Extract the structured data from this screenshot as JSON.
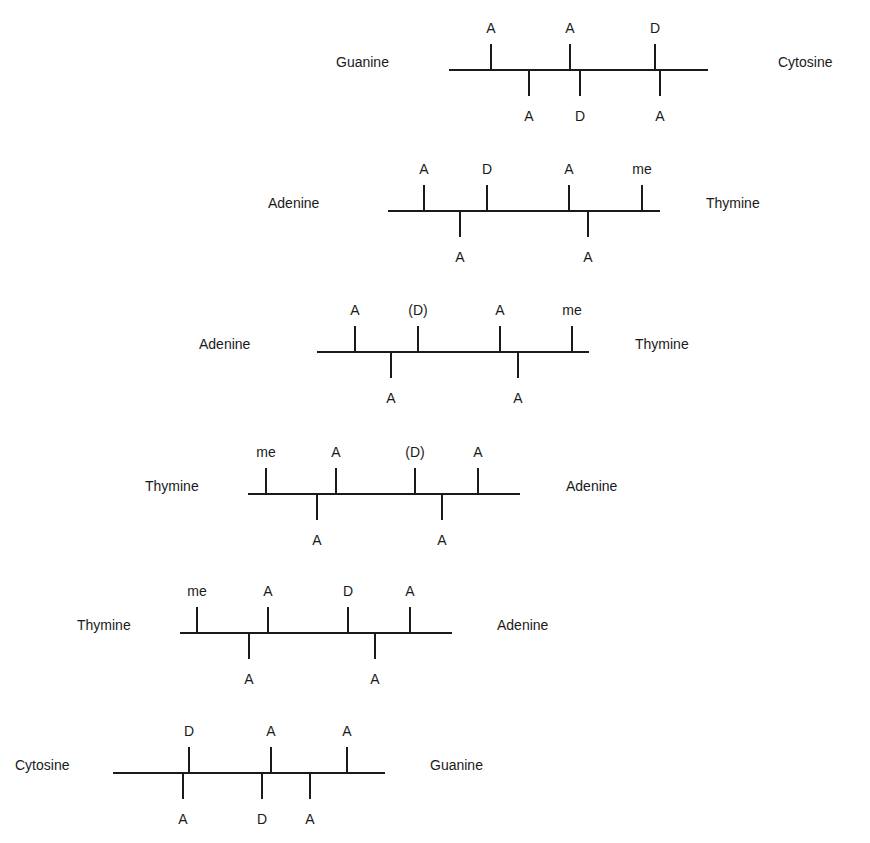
{
  "diagram": {
    "type": "base-pair hydrogen-bond acceptor/donor pattern diagram",
    "legend_codes": {
      "A": "acceptor",
      "D": "donor",
      "(D)": "weak donor",
      "me": "methyl"
    },
    "pairs": [
      {
        "left_base": "Guanine",
        "right_base": "Cytosine",
        "line": {
          "x1": 449,
          "x2": 708,
          "y": 70
        },
        "left_label_x": 336,
        "right_label_x": 778,
        "above": [
          {
            "x": 491,
            "label": "A"
          },
          {
            "x": 570,
            "label": "A"
          },
          {
            "x": 655,
            "label": "D"
          }
        ],
        "below": [
          {
            "x": 529,
            "label": "A"
          },
          {
            "x": 580,
            "label": "D"
          },
          {
            "x": 660,
            "label": "A"
          }
        ]
      },
      {
        "left_base": "Adenine",
        "right_base": "Thymine",
        "line": {
          "x1": 388,
          "x2": 660,
          "y": 211
        },
        "left_label_x": 268,
        "right_label_x": 706,
        "above": [
          {
            "x": 424,
            "label": "A"
          },
          {
            "x": 487,
            "label": "D"
          },
          {
            "x": 569,
            "label": "A"
          },
          {
            "x": 642,
            "label": "me"
          }
        ],
        "below": [
          {
            "x": 460,
            "label": "A"
          },
          {
            "x": 588,
            "label": "A"
          }
        ]
      },
      {
        "left_base": "Adenine",
        "right_base": "Thymine",
        "line": {
          "x1": 317,
          "x2": 589,
          "y": 352
        },
        "left_label_x": 199,
        "right_label_x": 635,
        "above": [
          {
            "x": 355,
            "label": "A"
          },
          {
            "x": 418,
            "label": "(D)"
          },
          {
            "x": 500,
            "label": "A"
          },
          {
            "x": 572,
            "label": "me"
          }
        ],
        "below": [
          {
            "x": 391,
            "label": "A"
          },
          {
            "x": 518,
            "label": "A"
          }
        ]
      },
      {
        "left_base": "Thymine",
        "right_base": "Adenine",
        "line": {
          "x1": 248,
          "x2": 520,
          "y": 494
        },
        "left_label_x": 145,
        "right_label_x": 566,
        "above": [
          {
            "x": 266,
            "label": "me"
          },
          {
            "x": 336,
            "label": "A"
          },
          {
            "x": 415,
            "label": "(D)"
          },
          {
            "x": 478,
            "label": "A"
          }
        ],
        "below": [
          {
            "x": 317,
            "label": "A"
          },
          {
            "x": 442,
            "label": "A"
          }
        ]
      },
      {
        "left_base": "Thymine",
        "right_base": "Adenine",
        "line": {
          "x1": 180,
          "x2": 452,
          "y": 633
        },
        "left_label_x": 77,
        "right_label_x": 497,
        "above": [
          {
            "x": 197,
            "label": "me"
          },
          {
            "x": 268,
            "label": "A"
          },
          {
            "x": 348,
            "label": "D"
          },
          {
            "x": 410,
            "label": "A"
          }
        ],
        "below": [
          {
            "x": 249,
            "label": "A"
          },
          {
            "x": 375,
            "label": "A"
          }
        ]
      },
      {
        "left_base": "Cytosine",
        "right_base": "Guanine",
        "line": {
          "x1": 113,
          "x2": 385,
          "y": 773
        },
        "left_label_x": 15,
        "right_label_x": 430,
        "above": [
          {
            "x": 189,
            "label": "D"
          },
          {
            "x": 271,
            "label": "A"
          },
          {
            "x": 347,
            "label": "A"
          }
        ],
        "below": [
          {
            "x": 183,
            "label": "A"
          },
          {
            "x": 262,
            "label": "D"
          },
          {
            "x": 310,
            "label": "A"
          }
        ]
      }
    ]
  }
}
